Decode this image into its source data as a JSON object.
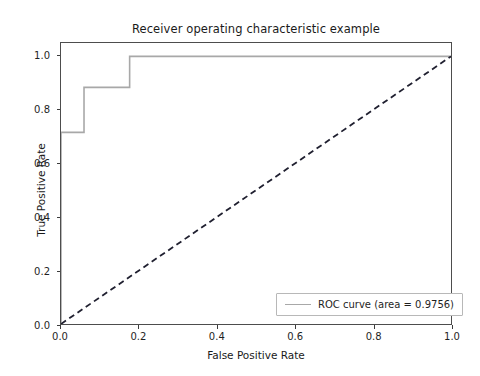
{
  "chart_data": {
    "type": "line",
    "title": "Receiver operating characteristic example",
    "xlabel": "False Positive Rate",
    "ylabel": "True Positive Rate",
    "xlim": [
      0.0,
      1.0
    ],
    "ylim": [
      0.0,
      1.05
    ],
    "grid": false,
    "legend_position": "lower right",
    "xticks": [
      "0.0",
      "0.2",
      "0.4",
      "0.6",
      "0.8",
      "1.0"
    ],
    "xtick_values": [
      0.0,
      0.2,
      0.4,
      0.6,
      0.8,
      1.0
    ],
    "yticks": [
      "0.0",
      "0.2",
      "0.4",
      "0.6",
      "0.8",
      "1.0"
    ],
    "ytick_values": [
      0.0,
      0.2,
      0.4,
      0.6,
      0.8,
      1.0
    ],
    "series": [
      {
        "name": "ROC curve (area = 0.9756)",
        "drawstyle": "steps-post",
        "color": "#a8a8a8",
        "linestyle": "solid",
        "linewidth": 1.6,
        "x": [
          0.0,
          0.0,
          0.059,
          0.059,
          0.176,
          0.176,
          1.0
        ],
        "y": [
          0.0,
          0.716,
          0.716,
          0.884,
          0.884,
          1.0,
          1.0
        ]
      },
      {
        "name": "chance-diagonal",
        "color": "#202030",
        "linestyle": "dashed",
        "linewidth": 1.8,
        "x": [
          0.0,
          1.0
        ],
        "y": [
          0.0,
          1.0
        ]
      }
    ],
    "annotations": {
      "auc": 0.9756
    }
  },
  "legend": {
    "entries": [
      {
        "label": "ROC curve (area = 0.9756)",
        "color": "#a8a8a8"
      }
    ]
  }
}
